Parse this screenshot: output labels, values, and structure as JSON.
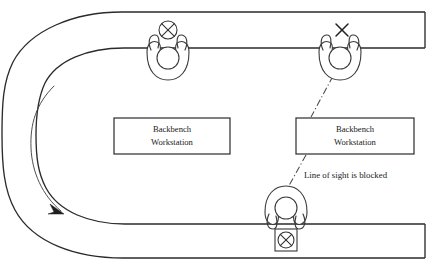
{
  "diagram": {
    "title": "Backbench Workstation Line of Sight",
    "canvas": {
      "width": 445,
      "height": 274
    },
    "colors": {
      "background": "#ffffff",
      "wall_stroke": "#2b2b2b",
      "figure_stroke": "#3a3a3a",
      "sight_line": "#4a4a4a",
      "text": "#1a1a1a"
    }
  },
  "corridor": {
    "name": "u-shaped-corridor",
    "top_outer_y": 12,
    "top_inner_y": 48,
    "bottom_inner_y": 224,
    "bottom_outer_y": 258,
    "right_edge_x": 425,
    "outer_left_x": 6,
    "inner_left_x": 40
  },
  "flow": {
    "name": "traffic-flow-arrow",
    "direction": "counterclockwise-downward",
    "arrow_at": {
      "x": 62,
      "y": 212
    }
  },
  "workstations": [
    {
      "id": "workstation-left",
      "label_line1": "Backbench",
      "label_line2": "Workstation",
      "x": 114,
      "y": 118,
      "width": 116,
      "height": 36
    },
    {
      "id": "workstation-right",
      "label_line1": "Backbench",
      "label_line2": "Workstation",
      "x": 296,
      "y": 118,
      "width": 118,
      "height": 36
    }
  ],
  "figures": [
    {
      "id": "person-top-left",
      "label": "staff-member-with-visible-target",
      "cx": 168,
      "cy": 58,
      "marker": "circled-x",
      "marker_cx": 168,
      "marker_cy": 30,
      "marker_r": 9
    },
    {
      "id": "person-top-right",
      "label": "staff-member-with-blocked-view",
      "cx": 340,
      "cy": 58,
      "marker": "plain-x",
      "marker_cx": 342,
      "marker_cy": 30,
      "marker_r": 8
    },
    {
      "id": "person-bottom",
      "label": "staff-member-at-boxed-target",
      "cx": 286,
      "cy": 214,
      "marker": "boxed-circled-x",
      "marker_cx": 286,
      "marker_cy": 240,
      "marker_r": 10
    }
  ],
  "sight_line": {
    "name": "line-of-sight-blocked",
    "note": "Line of sight is blocked",
    "note_x": 304,
    "note_y": 176,
    "upper_segment": {
      "x1": 333,
      "y1": 76,
      "x2": 311,
      "y2": 117
    },
    "lower_segment": {
      "x1": 306,
      "y1": 155,
      "x2": 281,
      "y2": 200
    },
    "style": "dash-dot"
  }
}
